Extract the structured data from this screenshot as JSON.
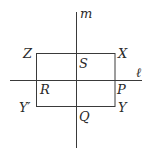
{
  "diagram": {
    "lines": {
      "m": {
        "label": "m",
        "x": 76,
        "y1": 12,
        "y2": 148
      },
      "l": {
        "label": "ℓ",
        "y": 80.5,
        "x1": 10,
        "x2": 142
      }
    },
    "rectangle": {
      "x": 36.5,
      "y": 53.5,
      "width": 78.5,
      "height": 53
    },
    "points": {
      "Z": "Z",
      "X": "X",
      "S": "S",
      "R": "R",
      "P": "P",
      "Y_prime": "Y′",
      "Q": "Q",
      "Y": "Y"
    },
    "colors": {
      "stroke": "#3a3a3a",
      "text": "#2a2a2a",
      "background": "#ffffff"
    }
  }
}
